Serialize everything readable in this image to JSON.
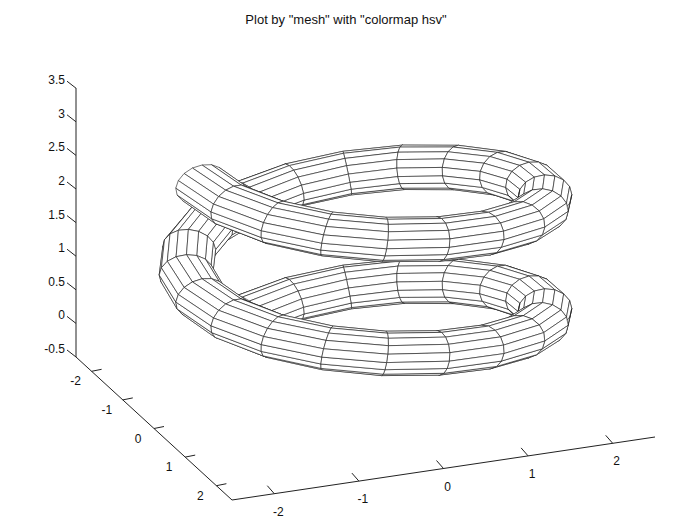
{
  "title": "Plot by \"mesh\" with \"colormap hsv\"",
  "chart_data": {
    "type": "mesh-3d",
    "title": "Plot by \"mesh\" with \"colormap hsv\"",
    "xlabel": "",
    "ylabel": "",
    "zlabel": "",
    "x_axis": {
      "ticks": [
        -2,
        -1,
        0,
        1,
        2
      ],
      "tick_labels": [
        "-2",
        "-1",
        "0",
        "1",
        "2"
      ],
      "range": [
        -2.5,
        2.5
      ]
    },
    "y_axis": {
      "ticks": [
        -2,
        -1,
        0,
        1,
        2
      ],
      "tick_labels": [
        "-2",
        "-1",
        "0",
        "1",
        "2"
      ],
      "range": [
        -2.5,
        2.5
      ]
    },
    "z_axis": {
      "ticks": [
        -0.5,
        0,
        0.5,
        1,
        1.5,
        2,
        2.5,
        3,
        3.5
      ],
      "tick_labels": [
        "-0.5",
        "0",
        "0.5",
        "1",
        "1.5",
        "2",
        "2.5",
        "3",
        "3.5"
      ],
      "range": [
        -0.5,
        3.5
      ]
    },
    "grid": false,
    "colormap": "hsv",
    "surface": {
      "shape": "helical tube",
      "helix_radius": 2,
      "tube_radius": 0.3,
      "turns": 1.8,
      "z_start": 0.05,
      "z_end": 3.1,
      "segments_along": 36,
      "segments_around": 16
    }
  },
  "axes": {
    "z_tick_labels": [
      "-0.5",
      "0",
      "0.5",
      "1",
      "1.5",
      "2",
      "2.5",
      "3",
      "3.5"
    ],
    "y_tick_labels": [
      "-2",
      "-1",
      "0",
      "1",
      "2"
    ],
    "x_tick_labels": [
      "-2",
      "-1",
      "0",
      "1",
      "2"
    ]
  }
}
